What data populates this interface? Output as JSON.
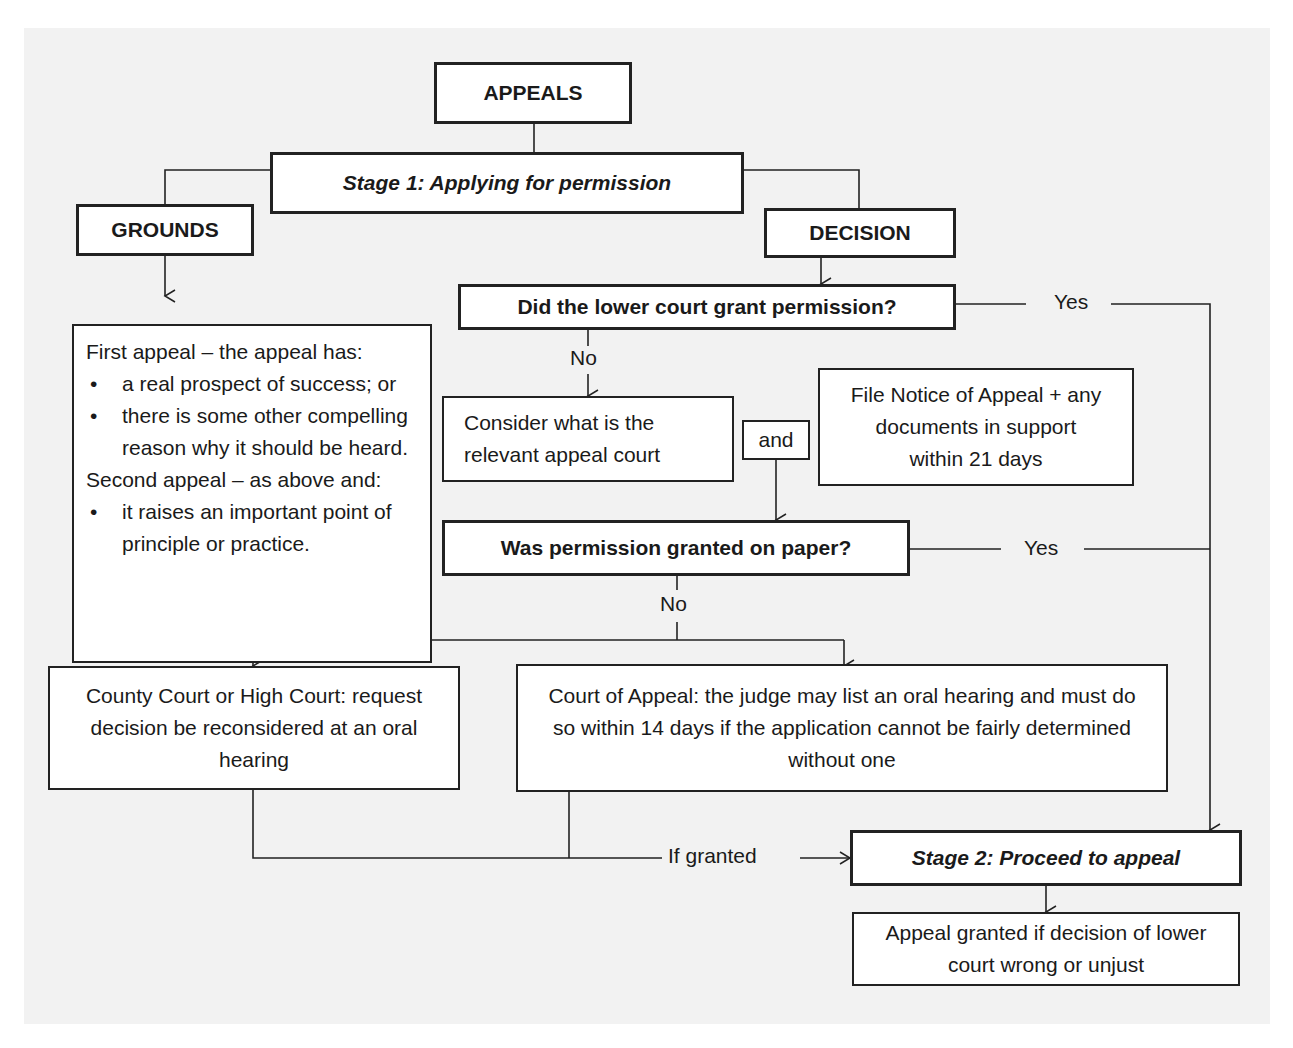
{
  "header_fragment": "g           Appeal process",
  "nodes": {
    "appeals": "APPEALS",
    "stage1": "Stage 1: Applying for permission",
    "grounds": "GROUNDS",
    "decision": "DECISION",
    "lower_court_question": "Did the lower court grant permission?",
    "consider_court": "Consider what is the relevant appeal court",
    "and": "and",
    "file_notice": "File Notice of Appeal + any documents in support within 21 days",
    "paper_question": "Was permission granted on paper?",
    "county_high_court": "County Court or High Court: request decision be reconsidered at an oral hearing",
    "court_of_appeal": "Court of Appeal: the judge may list an oral hearing and must do so within 14 days if the application cannot be fairly determined without one",
    "stage2": "Stage 2: Proceed to appeal",
    "appeal_granted": "Appeal granted if decision of lower court wrong or unjust"
  },
  "grounds_text": {
    "first_heading": "First appeal – the appeal has:",
    "first_bullets": [
      "a real prospect of success; or",
      "there is some other compelling reason why it should be heard."
    ],
    "second_heading": "Second appeal – as above and:",
    "second_bullets": [
      "it raises an important point of principle or practice."
    ],
    "bullet_symbol": "•"
  },
  "edge_labels": {
    "yes_1": "Yes",
    "no_1": "No",
    "yes_2": "Yes",
    "no_2": "No",
    "if_granted": "If granted"
  }
}
